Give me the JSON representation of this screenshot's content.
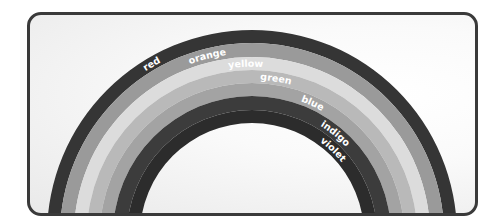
{
  "diagram": {
    "title": "",
    "center": {
      "x": 250,
      "y": 232
    },
    "bands": [
      {
        "label": "red",
        "outer_r": 205,
        "inner_r": 192,
        "color": "#353535",
        "label_angle_deg": 123
      },
      {
        "label": "orange",
        "outer_r": 192,
        "inner_r": 178,
        "color": "#9a9a9a",
        "label_angle_deg": 110
      },
      {
        "label": "yellow",
        "outer_r": 178,
        "inner_r": 165,
        "color": "#dcdcdc",
        "label_angle_deg": 98
      },
      {
        "label": "green",
        "outer_r": 165,
        "inner_r": 152,
        "color": "#b9b9b9",
        "label_angle_deg": 87
      },
      {
        "label": "blue",
        "outer_r": 152,
        "inner_r": 139,
        "color": "#a3a3a3",
        "label_angle_deg": 70
      },
      {
        "label": "indigo",
        "outer_r": 139,
        "inner_r": 125,
        "color": "#3c3c3c",
        "label_angle_deg": 58
      },
      {
        "label": "violet",
        "outer_r": 125,
        "inner_r": 112,
        "color": "#2c2c2c",
        "label_angle_deg": 54
      }
    ],
    "frame_border_color": "#3a3a3a"
  }
}
